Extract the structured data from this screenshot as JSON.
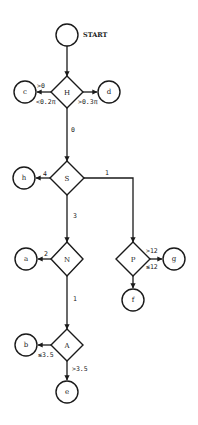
{
  "diagram": {
    "type": "flowchart",
    "nodes": {
      "start": {
        "label": "",
        "caption": "START",
        "shape": "circle"
      },
      "H": {
        "label": "H",
        "shape": "diamond"
      },
      "c": {
        "label": "c",
        "shape": "circle"
      },
      "d": {
        "label": "d",
        "shape": "circle"
      },
      "S": {
        "label": "S",
        "shape": "diamond"
      },
      "h": {
        "label": "h",
        "shape": "circle"
      },
      "N": {
        "label": "N",
        "shape": "diamond"
      },
      "a": {
        "label": "a",
        "shape": "circle"
      },
      "P": {
        "label": "P",
        "shape": "diamond"
      },
      "g": {
        "label": "g",
        "shape": "circle"
      },
      "f": {
        "label": "f",
        "shape": "circle"
      },
      "A": {
        "label": "A",
        "shape": "diamond"
      },
      "b": {
        "label": "b",
        "shape": "circle"
      },
      "e": {
        "label": "e",
        "shape": "circle"
      }
    },
    "edges": {
      "start_H": {
        "from": "start",
        "to": "H",
        "label": ""
      },
      "H_c": {
        "from": "H",
        "to": "c",
        "label_top": ">0",
        "label_bottom": "<0.2π"
      },
      "H_d": {
        "from": "H",
        "to": "d",
        "label": ">0.3π"
      },
      "H_S": {
        "from": "H",
        "to": "S",
        "label": "0"
      },
      "S_h": {
        "from": "S",
        "to": "h",
        "label": "4"
      },
      "S_P": {
        "from": "S",
        "to": "P",
        "label": "1"
      },
      "S_N": {
        "from": "S",
        "to": "N",
        "label": "3"
      },
      "N_a": {
        "from": "N",
        "to": "a",
        "label": "2"
      },
      "N_A": {
        "from": "N",
        "to": "A",
        "label": "1"
      },
      "P_g": {
        "from": "P",
        "to": "g",
        "label_top": ">12",
        "label_bottom": "≤12"
      },
      "P_f": {
        "from": "P",
        "to": "f",
        "label": ""
      },
      "A_b": {
        "from": "A",
        "to": "b",
        "label": "≤3.5"
      },
      "A_e": {
        "from": "A",
        "to": "e",
        "label": ">3.5"
      }
    }
  }
}
